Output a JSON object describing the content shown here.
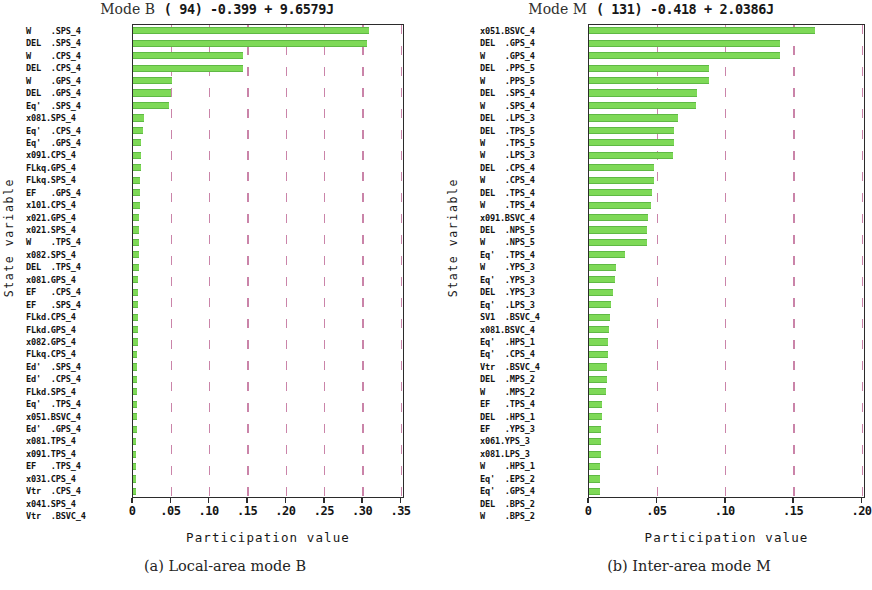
{
  "figure": {
    "panels": [
      {
        "caption": "(a) Local-area mode B",
        "title_mode": "Mode B",
        "title_eig": "(  94) -0.399 + 9.6579J",
        "xlabel": "Participation value",
        "ylabel": "State variable"
      },
      {
        "caption": "(b) Inter-area mode M",
        "title_mode": "Mode M",
        "title_eig": "( 131) -0.418 + 2.0386J",
        "xlabel": "Participation value",
        "ylabel": "State variable"
      }
    ]
  },
  "chart_data": [
    {
      "type": "bar",
      "orientation": "horizontal",
      "title": "Mode B (  94) -0.399 + 9.6579J",
      "xlabel": "Participation value",
      "ylabel": "State variable",
      "xlim": [
        0,
        0.35
      ],
      "xticks": [
        0,
        0.05,
        0.1,
        0.15,
        0.2,
        0.25,
        0.3,
        0.35
      ],
      "xticklabels": [
        "0",
        ".05",
        ".10",
        ".15",
        ".20",
        ".25",
        ".30",
        ".35"
      ],
      "grid": "vertical-dashed",
      "legend": "none",
      "bar_color": "#7ed957",
      "categories": [
        "W    .SPS_4",
        "DEL  .SPS_4",
        "W    .CPS_4",
        "DEL  .CPS_4",
        "W    .GPS_4",
        "DEL  .GPS_4",
        "Eq'  .SPS_4",
        "x081.SPS_4",
        "Eq'  .CPS_4",
        "Eq'  .GPS_4",
        "x091.CPS_4",
        "FLkq.GPS_4",
        "FLkq.SPS_4",
        "EF   .GPS_4",
        "x101.CPS_4",
        "x021.GPS_4",
        "x021.SPS_4",
        "W    .TPS_4",
        "x082.SPS_4",
        "DEL  .TPS_4",
        "x081.GPS_4",
        "EF   .CPS_4",
        "EF   .SPS_4",
        "FLkd.CPS_4",
        "FLkd.GPS_4",
        "x082.GPS_4",
        "FLkq.CPS_4",
        "Ed'  .SPS_4",
        "Ed'  .CPS_4",
        "FLkd.SPS_4",
        "Eq'  .TPS_4",
        "x051.BSVC_4",
        "Ed'  .GPS_4",
        "x081.TPS_4",
        "x091.TPS_4",
        "EF   .TPS_4",
        "x031.CPS_4",
        "Vtr  .CPS_4",
        "x041.SPS_4",
        "Vtr  .BSVC_4"
      ],
      "values": [
        0.308,
        0.305,
        0.144,
        0.143,
        0.0505,
        0.05,
        0.0475,
        0.0145,
        0.0125,
        0.011,
        0.0105,
        0.01,
        0.0095,
        0.009,
        0.0085,
        0.0082,
        0.008,
        0.0078,
        0.0075,
        0.0072,
        0.007,
        0.0068,
        0.0066,
        0.0064,
        0.0062,
        0.006,
        0.0058,
        0.0056,
        0.0054,
        0.0052,
        0.005,
        0.0048,
        0.0046,
        0.0044,
        0.0042,
        0.004,
        0.0038,
        0.0036,
        0.0034,
        0.0032
      ]
    },
    {
      "type": "bar",
      "orientation": "horizontal",
      "title": "Mode M ( 131) -0.418 + 2.0386J",
      "xlabel": "Participation value",
      "ylabel": "State variable",
      "xlim": [
        0,
        0.2
      ],
      "xticks": [
        0,
        0.05,
        0.1,
        0.15,
        0.2
      ],
      "xticklabels": [
        "0",
        ".05",
        ".10",
        ".15",
        ".20"
      ],
      "grid": "vertical-dashed",
      "legend": "none",
      "bar_color": "#7ed957",
      "categories": [
        "x051.BSVC_4",
        "DEL  .GPS_4",
        "W    .GPS_4",
        "DEL  .PPS_5",
        "W    .PPS_5",
        "DEL  .SPS_4",
        "W    .SPS_4",
        "DEL  .LPS_3",
        "DEL  .TPS_5",
        "W    .TPS_5",
        "W    .LPS_3",
        "DEL  .CPS_4",
        "W    .CPS_4",
        "DEL  .TPS_4",
        "W    .TPS_4",
        "x091.BSVC_4",
        "DEL  .NPS_5",
        "W    .NPS_5",
        "Eq'  .TPS_4",
        "W    .YPS_3",
        "Eq'  .YPS_3",
        "DEL  .YPS_3",
        "Eq'  .LPS_3",
        "SV1  .BSVC_4",
        "x081.BSVC_4",
        "Eq'  .HPS_1",
        "Eq'  .CPS_4",
        "Vtr  .BSVC_4",
        "DEL  .MPS_2",
        "W    .MPS_2",
        "EF   .TPS_4",
        "DEL  .HPS_1",
        "EF   .YPS_3",
        "x061.YPS_3",
        "x081.LPS_3",
        "W    .HPS_1",
        "Eq'  .EPS_2",
        "Eq'  .GPS_4",
        "DEL  .BPS_2",
        "W    .BPS_2"
      ],
      "values": [
        0.1655,
        0.14,
        0.1395,
        0.088,
        0.0875,
        0.079,
        0.0785,
        0.065,
        0.0625,
        0.062,
        0.0615,
        0.0478,
        0.0472,
        0.046,
        0.045,
        0.0432,
        0.0425,
        0.0422,
        0.026,
        0.0195,
        0.0192,
        0.0178,
        0.016,
        0.015,
        0.0145,
        0.0142,
        0.0138,
        0.0132,
        0.0128,
        0.0125,
        0.0095,
        0.0092,
        0.009,
        0.0088,
        0.0086,
        0.0084,
        0.0082,
        0.008,
        0.007,
        0.006
      ]
    }
  ]
}
